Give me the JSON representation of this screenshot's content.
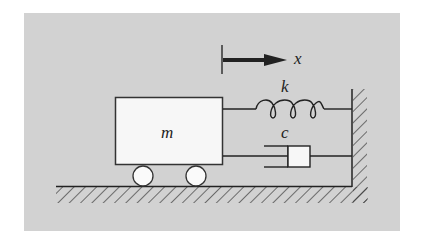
{
  "diagram": {
    "labels": {
      "displacement": "x",
      "spring": "k",
      "damper": "c",
      "mass": "m"
    },
    "colors": {
      "background": "#d2d2d2",
      "stroke": "#222222",
      "fill": "#f7f7f7"
    },
    "components": [
      {
        "name": "mass",
        "label": "m"
      },
      {
        "name": "spring",
        "label": "k",
        "coils": 3
      },
      {
        "name": "damper",
        "label": "c"
      },
      {
        "name": "wheels",
        "count": 2
      },
      {
        "name": "ground",
        "type": "hatched"
      },
      {
        "name": "wall",
        "type": "hatched"
      },
      {
        "name": "displacement-arrow",
        "label": "x",
        "direction": "right"
      }
    ]
  }
}
